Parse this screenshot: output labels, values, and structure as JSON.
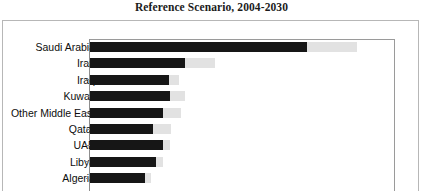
{
  "title": "Reference Scenario, 2004-2030",
  "chart_data": {
    "type": "bar",
    "orientation": "horizontal",
    "stacked": true,
    "title": "Reference Scenario, 2004-2030",
    "xlabel": "",
    "ylabel": "",
    "grid": false,
    "legend_position": "none",
    "axis_max_px": 306,
    "categories": [
      "Saudi Arabia",
      "Iran",
      "Iraq",
      "Kuwait",
      "Other Middle East",
      "Qatar",
      "UAE",
      "Libya",
      "Algeria"
    ],
    "series": [
      {
        "name": "2004",
        "color": "#161616",
        "values": [
          218,
          95,
          79,
          80,
          73,
          63,
          73,
          66,
          55
        ]
      },
      {
        "name": "Increase to 2030",
        "color": "#e2e2e2",
        "values": [
          50,
          30,
          10,
          15,
          18,
          18,
          7,
          7,
          6
        ]
      }
    ],
    "bars": [
      {
        "label": "Saudi Arabia",
        "dark": 218,
        "light": 50,
        "total": 268
      },
      {
        "label": "Iran",
        "dark": 95,
        "light": 30,
        "total": 125
      },
      {
        "label": "Iraq",
        "dark": 79,
        "light": 10,
        "total": 89
      },
      {
        "label": "Kuwait",
        "dark": 80,
        "light": 15,
        "total": 95
      },
      {
        "label": "Other Middle East",
        "dark": 73,
        "light": 18,
        "total": 91
      },
      {
        "label": "Qatar",
        "dark": 63,
        "light": 18,
        "total": 81
      },
      {
        "label": "UAE",
        "dark": 73,
        "light": 7,
        "total": 80
      },
      {
        "label": "Libya",
        "dark": 66,
        "light": 7,
        "total": 73
      },
      {
        "label": "Algeria",
        "dark": 55,
        "light": 6,
        "total": 61
      }
    ]
  },
  "colors": {
    "series_dark": "#161616",
    "series_light": "#e2e2e2",
    "axis": "#8d8d8d",
    "frame": "#b7b7b7",
    "text": "#0d0d0d"
  }
}
